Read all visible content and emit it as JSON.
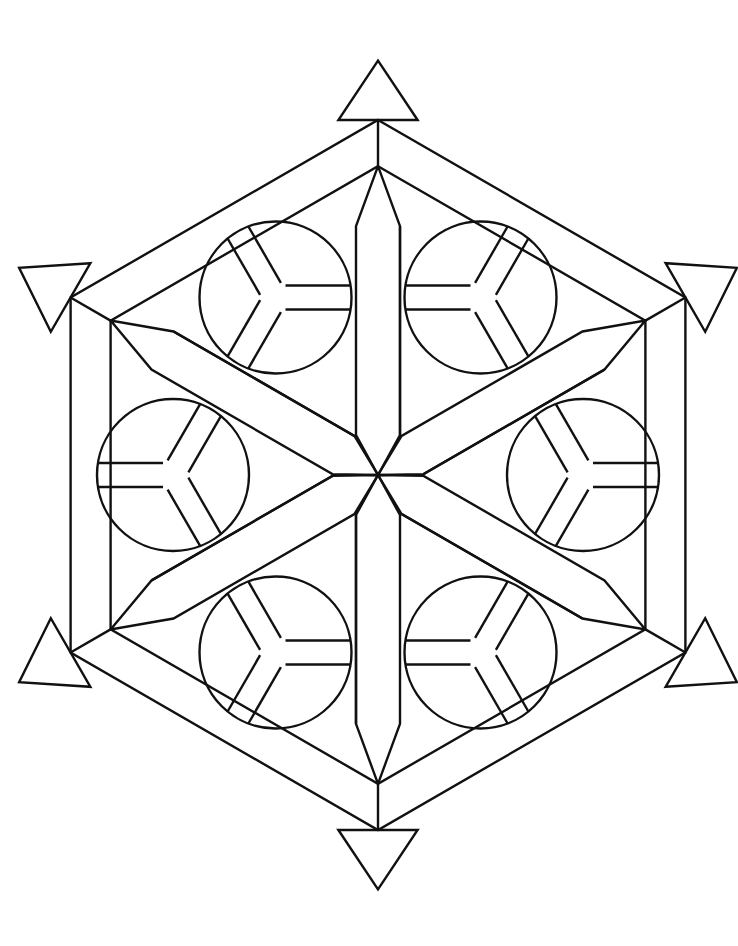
{
  "artwork": {
    "title": "",
    "kind": "geometric hexagon mandala coloring page",
    "stroke_color": "#111111",
    "background": "#ffffff",
    "center": [
      378,
      475
    ],
    "outer_hex_radius": 355,
    "hex_band_width": 40,
    "spoke_half_width": 22,
    "inner_triangle_inset": 0.62,
    "circle_radius": 76,
    "circle_distance": 205,
    "circle_spoke_half_width": 12,
    "corner_triangle_size": 66,
    "counts": {
      "spokes": 6,
      "circles": 6,
      "corner_triangles": 6
    }
  }
}
